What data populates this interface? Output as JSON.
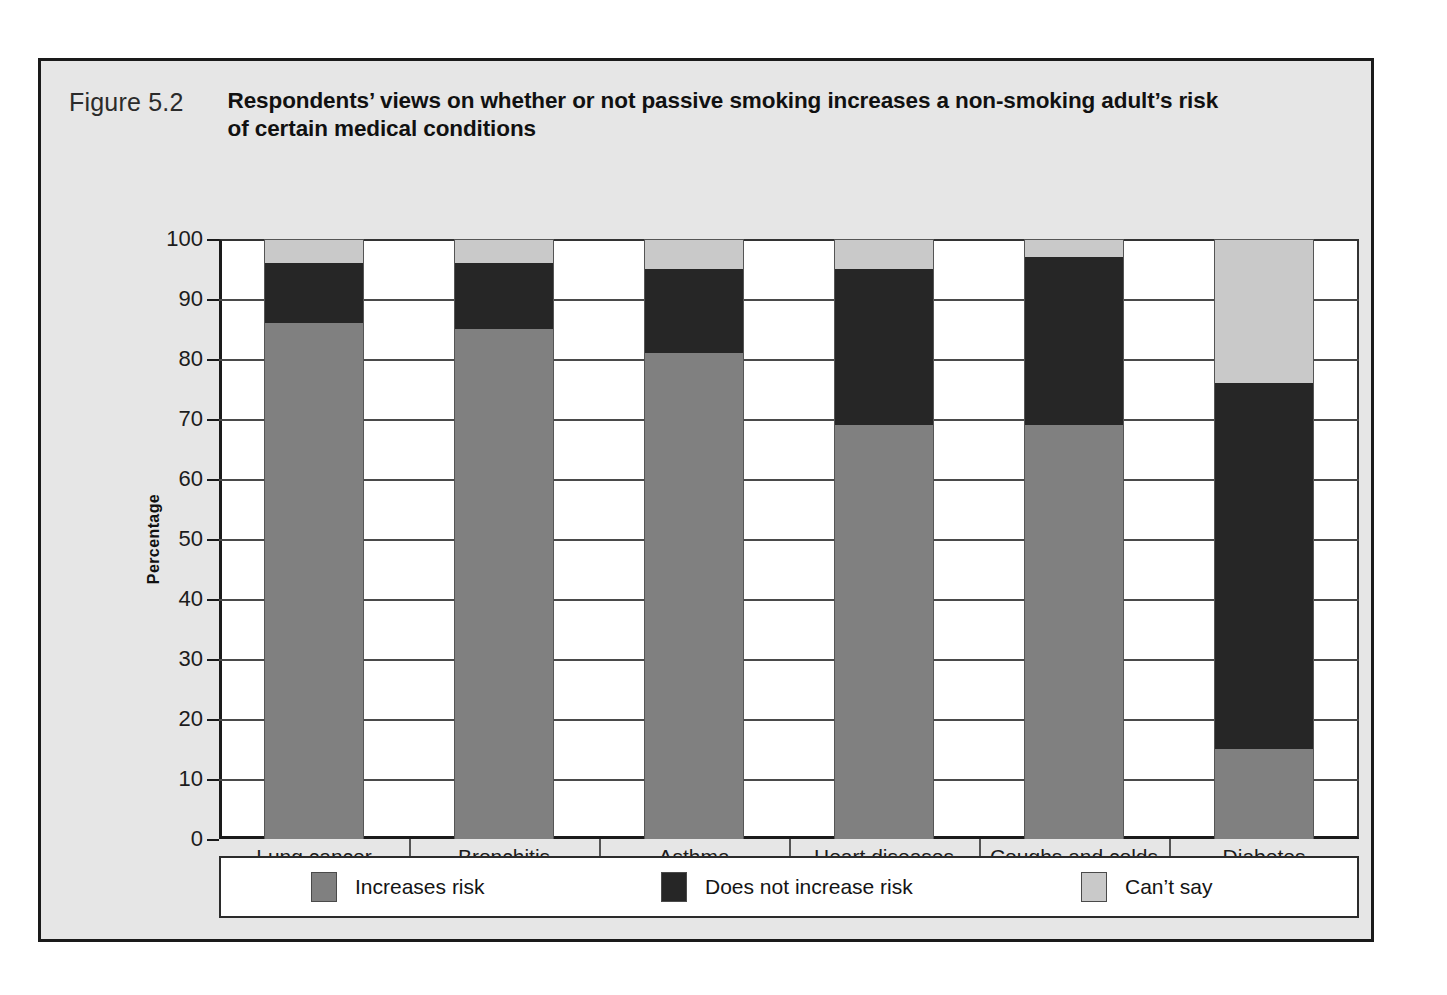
{
  "figure": {
    "number": "Figure 5.2",
    "title": "Respondents’ views on whether or not passive smoking increases a non-smoking adult’s risk of certain medical conditions"
  },
  "axes": {
    "y_title": "Percentage",
    "y_ticks": [
      "100",
      "90",
      "80",
      "70",
      "60",
      "50",
      "40",
      "30",
      "20",
      "10",
      "0"
    ],
    "y_min": 0,
    "y_max": 100
  },
  "legend": [
    {
      "label": "Increases risk",
      "color": "#808080",
      "swatch": "increases-risk-swatch"
    },
    {
      "label": "Does not increase risk",
      "color": "#262626",
      "swatch": "does-not-increase-risk-swatch"
    },
    {
      "label": "Can’t say",
      "color": "#c9c9c9",
      "swatch": "cant-say-swatch"
    }
  ],
  "chart_data": {
    "type": "bar",
    "subtype": "stacked-column-100",
    "title": "Respondents’ views on whether or not passive smoking increases a non-smoking adult’s risk of certain medical conditions",
    "xlabel": "",
    "ylabel": "Percentage",
    "ylim": [
      0,
      100
    ],
    "y_ticks": [
      0,
      10,
      20,
      30,
      40,
      50,
      60,
      70,
      80,
      90,
      100
    ],
    "grid": true,
    "legend_position": "bottom",
    "categories": [
      "Lung cancer",
      "Bronchitis",
      "Asthma",
      "Heart diseases",
      "Coughs and colds",
      "Diabetes"
    ],
    "series": [
      {
        "name": "Increases risk",
        "color": "#808080",
        "values": [
          86,
          85,
          81,
          69,
          69,
          15
        ]
      },
      {
        "name": "Does not increase risk",
        "color": "#262626",
        "values": [
          10,
          11,
          14,
          26,
          28,
          61
        ]
      },
      {
        "name": "Can’t say",
        "color": "#c9c9c9",
        "values": [
          4,
          4,
          5,
          5,
          3,
          24
        ]
      }
    ],
    "stack_order_bottom_to_top": [
      "Increases risk",
      "Does not increase risk",
      "Can’t say"
    ],
    "note": "Stacked segments read bottom-to-top: light grey base is 'Increases risk' series extent, dark block is 'Does not increase risk', top grey cap is 'Can’t say'."
  }
}
